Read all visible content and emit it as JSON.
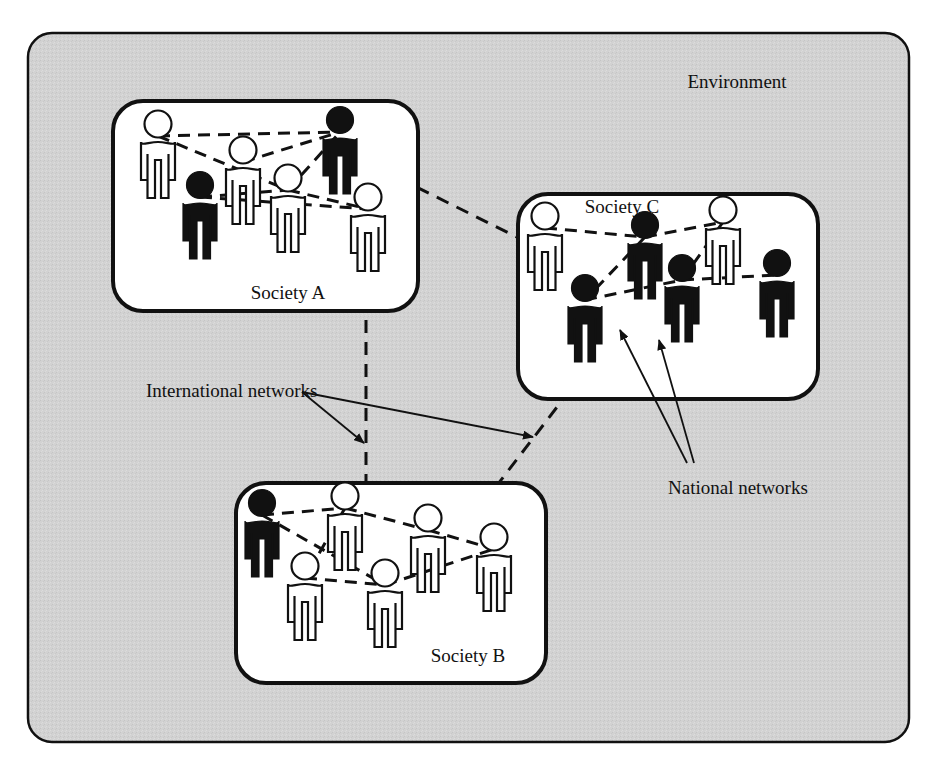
{
  "figure": {
    "background_color": "#ffffff",
    "environment_fill": "#d2d2d2",
    "stroke_color": "#111111",
    "society_fill": "#ffffff"
  },
  "environment": {
    "label": "Environment",
    "label_x": 737,
    "label_y": 88
  },
  "labels": {
    "international_networks": "International networks",
    "national_networks": "National networks"
  },
  "societies": [
    {
      "id": "society-a",
      "label": "Society A",
      "label_x": 288,
      "label_y": 299,
      "box": {
        "x": 113,
        "y": 101,
        "width": 305,
        "height": 210,
        "radius": 30
      },
      "people": [
        {
          "id": "a1",
          "x": 158,
          "y": 124,
          "scale": 1.0,
          "filled": false
        },
        {
          "id": "a2",
          "x": 243,
          "y": 150,
          "scale": 1.0,
          "filled": false
        },
        {
          "id": "a3",
          "x": 288,
          "y": 178,
          "scale": 1.0,
          "filled": false
        },
        {
          "id": "a4",
          "x": 340,
          "y": 120,
          "scale": 1.0,
          "filled": true
        },
        {
          "id": "a5",
          "x": 200,
          "y": 185,
          "scale": 1.0,
          "filled": true
        },
        {
          "id": "a6",
          "x": 368,
          "y": 197,
          "scale": 1.0,
          "filled": false
        }
      ],
      "links": [
        [
          "a1",
          "a4"
        ],
        [
          "a1",
          "a3"
        ],
        [
          "a2",
          "a4"
        ],
        [
          "a3",
          "a4"
        ],
        [
          "a5",
          "a3"
        ],
        [
          "a5",
          "a6"
        ],
        [
          "a3",
          "a6"
        ]
      ]
    },
    {
      "id": "society-c",
      "label": "Society C",
      "label_x": 622,
      "label_y": 213,
      "box": {
        "x": 518,
        "y": 194,
        "width": 300,
        "height": 205,
        "radius": 30
      },
      "people": [
        {
          "id": "c1",
          "x": 545,
          "y": 216,
          "scale": 1.0,
          "filled": false
        },
        {
          "id": "c2",
          "x": 645,
          "y": 225,
          "scale": 1.0,
          "filled": true
        },
        {
          "id": "c3",
          "x": 723,
          "y": 210,
          "scale": 1.0,
          "filled": false
        },
        {
          "id": "c4",
          "x": 777,
          "y": 263,
          "scale": 1.0,
          "filled": true
        },
        {
          "id": "c5",
          "x": 682,
          "y": 268,
          "scale": 1.0,
          "filled": true
        },
        {
          "id": "c6",
          "x": 585,
          "y": 288,
          "scale": 1.0,
          "filled": true
        }
      ],
      "links": [
        [
          "c1",
          "c2"
        ],
        [
          "c2",
          "c3"
        ],
        [
          "c3",
          "c5"
        ],
        [
          "c2",
          "c6"
        ],
        [
          "c6",
          "c5"
        ],
        [
          "c5",
          "c4"
        ]
      ]
    },
    {
      "id": "society-b",
      "label": "Society B",
      "label_x": 468,
      "label_y": 662,
      "box": {
        "x": 236,
        "y": 483,
        "width": 310,
        "height": 200,
        "radius": 30
      },
      "people": [
        {
          "id": "b1",
          "x": 262,
          "y": 503,
          "scale": 1.0,
          "filled": true
        },
        {
          "id": "b2",
          "x": 345,
          "y": 496,
          "scale": 1.0,
          "filled": false
        },
        {
          "id": "b3",
          "x": 428,
          "y": 518,
          "scale": 1.0,
          "filled": false
        },
        {
          "id": "b4",
          "x": 494,
          "y": 537,
          "scale": 1.0,
          "filled": false
        },
        {
          "id": "b5",
          "x": 305,
          "y": 566,
          "scale": 1.0,
          "filled": false
        },
        {
          "id": "b6",
          "x": 385,
          "y": 573,
          "scale": 1.0,
          "filled": false
        }
      ],
      "links": [
        [
          "b1",
          "b2"
        ],
        [
          "b2",
          "b3"
        ],
        [
          "b1",
          "b6"
        ],
        [
          "b2",
          "b5"
        ],
        [
          "b5",
          "b6"
        ],
        [
          "b6",
          "b4"
        ],
        [
          "b3",
          "b4"
        ]
      ]
    }
  ],
  "international_links": [
    {
      "from": "society-a",
      "to": "society-c",
      "x1": 358,
      "y1": 158,
      "x2": 549,
      "y2": 253
    },
    {
      "from": "society-a",
      "to": "society-b",
      "x1": 366,
      "y1": 232,
      "x2": 366,
      "y2": 508
    },
    {
      "from": "society-b",
      "to": "society-c",
      "x1": 455,
      "y1": 540,
      "x2": 597,
      "y2": 355
    }
  ],
  "callouts": [
    {
      "id": "international-networks",
      "label": "International networks",
      "label_x": 146,
      "label_y": 397,
      "arrows": [
        {
          "x1": 302,
          "y1": 392,
          "x2": 364,
          "y2": 443
        },
        {
          "x1": 302,
          "y1": 392,
          "x2": 533,
          "y2": 437
        }
      ]
    },
    {
      "id": "national-networks",
      "label": "National networks",
      "label_x": 668,
      "label_y": 494,
      "arrows": [
        {
          "x1": 687,
          "y1": 463,
          "x2": 620,
          "y2": 330
        },
        {
          "x1": 694,
          "y1": 463,
          "x2": 659,
          "y2": 340
        }
      ]
    }
  ]
}
